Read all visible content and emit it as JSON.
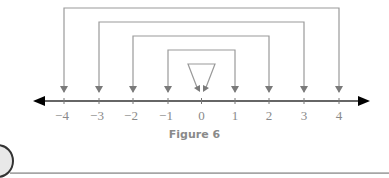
{
  "figure": {
    "caption": "Figure 6"
  },
  "number_line": {
    "min": -4,
    "max": 4,
    "ticks": [
      {
        "value": -4,
        "label": "−4"
      },
      {
        "value": -3,
        "label": "−3"
      },
      {
        "value": -2,
        "label": "−2"
      },
      {
        "value": -1,
        "label": "−1"
      },
      {
        "value": 0,
        "label": "0"
      },
      {
        "value": 1,
        "label": "1"
      },
      {
        "value": 2,
        "label": "2"
      },
      {
        "value": 3,
        "label": "3"
      },
      {
        "value": 4,
        "label": "4"
      }
    ],
    "arrows_both_ends": true
  },
  "connectors": [
    {
      "pair": [
        -4,
        4
      ]
    },
    {
      "pair": [
        -3,
        3
      ]
    },
    {
      "pair": [
        -2,
        2
      ]
    },
    {
      "pair": [
        -1,
        1
      ]
    },
    {
      "pair": [
        0,
        0
      ],
      "shape": "triangle"
    }
  ],
  "colors": {
    "connector": "#8a8a8a",
    "axis": "#1a1a1a",
    "label": "#8a8a8a"
  }
}
